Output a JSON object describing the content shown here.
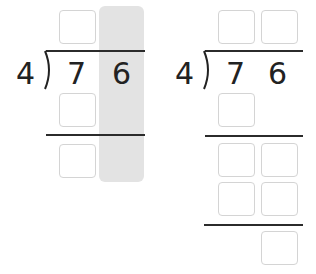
{
  "left_problem": {
    "divisor": "4",
    "dividend_digits": [
      "7",
      "6"
    ],
    "highlighted_column": "ones",
    "highlight_color": "#e3e3e3",
    "answer_boxes": 1,
    "work_boxes": [
      1,
      1
    ]
  },
  "right_problem": {
    "divisor": "4",
    "dividend_digits": [
      "7",
      "6"
    ],
    "answer_boxes": 2,
    "work_rows": [
      1,
      2,
      2
    ],
    "remainder_boxes": 1
  },
  "colors": {
    "line": "#2b2b2b",
    "box_border": "#d4d4d4",
    "text": "#222222"
  }
}
